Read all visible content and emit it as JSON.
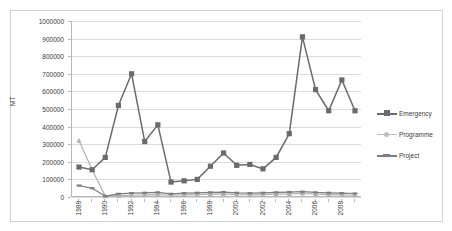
{
  "chart_data": {
    "type": "line",
    "title": "",
    "xlabel": "",
    "ylabel": "MT",
    "ylim": [
      0,
      1000000
    ],
    "ytick_values": [
      0,
      100000,
      200000,
      300000,
      400000,
      500000,
      600000,
      700000,
      800000,
      900000,
      1000000
    ],
    "ytick_labels": [
      "0",
      "100000",
      "200000",
      "300000",
      "400000",
      "500000",
      "600000",
      "700000",
      "800000",
      "900000",
      "1000000"
    ],
    "x": [
      1988,
      1989,
      1990,
      1991,
      1992,
      1993,
      1994,
      1995,
      1996,
      1997,
      1998,
      1999,
      2000,
      2001,
      2002,
      2003,
      2004,
      2005,
      2006,
      2007,
      2008,
      2009
    ],
    "xtick_labels": [
      "1988",
      "1990",
      "1992",
      "1994",
      "1996",
      "1998",
      "2000",
      "2002",
      "2004",
      "2006",
      "2008"
    ],
    "xtick_values": [
      1988,
      1990,
      1992,
      1994,
      1996,
      1998,
      2000,
      2002,
      2004,
      2006,
      2008
    ],
    "grid": true,
    "legend_position": "right",
    "series": [
      {
        "name": "Emergency",
        "color": "#6b6b6b",
        "marker": "square",
        "values": [
          170000,
          155000,
          225000,
          520000,
          700000,
          315000,
          410000,
          85000,
          92000,
          100000,
          175000,
          250000,
          180000,
          185000,
          160000,
          225000,
          360000,
          910000,
          610000,
          490000,
          665000,
          490000
        ]
      },
      {
        "name": "Programme",
        "color": "#b0b0b0",
        "marker": "triangle",
        "values": [
          320000,
          155000,
          5000,
          8000,
          10000,
          12000,
          14000,
          10000,
          12000,
          14000,
          16000,
          18000,
          14000,
          12000,
          14000,
          16000,
          18000,
          20000,
          16000,
          14000,
          12000,
          10000
        ]
      },
      {
        "name": "Project",
        "color": "#7d7d7d",
        "marker": "line",
        "values": [
          65000,
          50000,
          5000,
          18000,
          22000,
          24000,
          26000,
          18000,
          22000,
          24000,
          26000,
          28000,
          24000,
          22000,
          24000,
          26000,
          28000,
          30000,
          26000,
          24000,
          22000,
          20000
        ]
      }
    ]
  },
  "legend": {
    "items": [
      {
        "label": "Emergency"
      },
      {
        "label": "Programme"
      },
      {
        "label": "Project"
      }
    ]
  }
}
